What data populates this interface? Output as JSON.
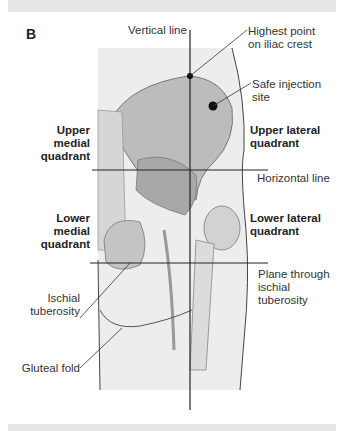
{
  "panel_label": "B",
  "labels": {
    "vertical_line": "Vertical line",
    "highest_point_1": "Highest point",
    "highest_point_2": "on iliac crest",
    "safe_site_1": "Safe injection",
    "safe_site_2": "site",
    "upper_medial_1": "Upper medial",
    "upper_medial_2": "quadrant",
    "upper_lateral_1": "Upper lateral",
    "upper_lateral_2": "quadrant",
    "horizontal_line": "Horizontal line",
    "lower_medial_1": "Lower medial",
    "lower_medial_2": "quadrant",
    "lower_lateral_1": "Lower lateral",
    "lower_lateral_2": "quadrant",
    "plane_1": "Plane through",
    "plane_2": "ischial",
    "plane_3": "tuberosity",
    "ischial_1": "Ischial",
    "ischial_2": "tuberosity",
    "gluteal_fold": "Gluteal fold"
  },
  "colors": {
    "bone": "#bdbdbd",
    "skin": "#ececec",
    "line": "#222222",
    "bar": "#e6e6e6"
  }
}
